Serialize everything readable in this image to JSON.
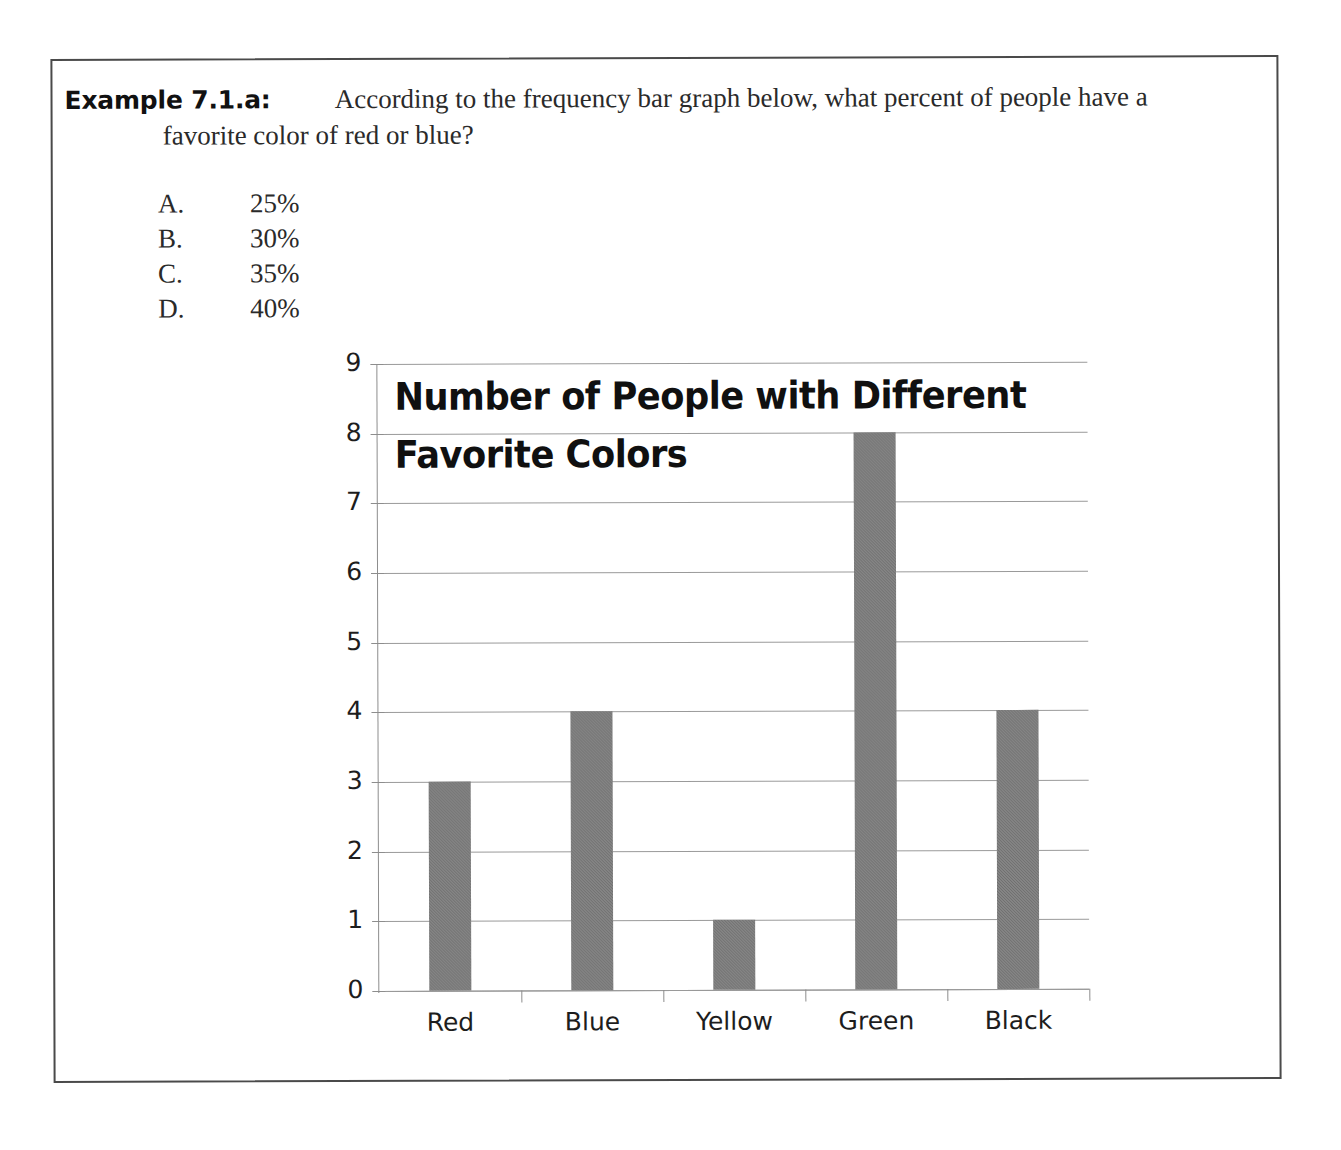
{
  "question": {
    "label": "Example 7.1.a:",
    "line1": "According to the frequency bar graph below, what percent of people have a",
    "line2": "favorite color of red or blue?"
  },
  "choices": [
    {
      "letter": "A.",
      "value": "25%"
    },
    {
      "letter": "B.",
      "value": "30%"
    },
    {
      "letter": "C.",
      "value": "35%"
    },
    {
      "letter": "D.",
      "value": "40%"
    }
  ],
  "chart_data": {
    "type": "bar",
    "title": "Number of People with Different Favorite Colors",
    "title_line1": "Number of People with Different",
    "title_line2": "Favorite Colors",
    "categories": [
      "Red",
      "Blue",
      "Yellow",
      "Green",
      "Black"
    ],
    "values": [
      3,
      4,
      1,
      8,
      4
    ],
    "xlabel": "",
    "ylabel": "",
    "ylim": [
      0,
      9
    ],
    "ytick_labels": [
      "9",
      "8",
      "7",
      "6",
      "5",
      "4",
      "3",
      "2",
      "1",
      "0"
    ],
    "grid": true,
    "legend": "none",
    "bar_color": "#6e6e6e",
    "axis_color": "#8d8d8d"
  },
  "style": {
    "border_color": "#4a4a4a",
    "page_background": "#ffffff",
    "text_color": "#2a2a2a"
  }
}
